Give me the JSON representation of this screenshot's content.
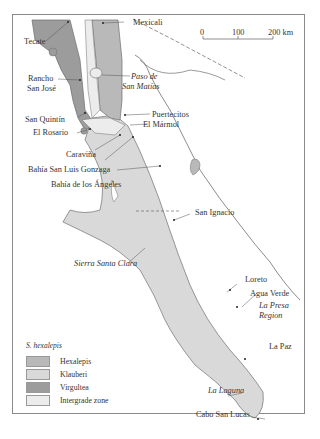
{
  "map": {
    "scale_bar": {
      "ticks": [
        "0",
        "100",
        "200 km"
      ]
    },
    "places": [
      {
        "name": "Mexicali",
        "italic": false
      },
      {
        "name": "Tecate",
        "italic": false
      },
      {
        "name": "Rancho",
        "italic": false
      },
      {
        "name": "San José",
        "italic": false
      },
      {
        "name": "Paso de",
        "italic": true
      },
      {
        "name": "San Matías",
        "italic": true
      },
      {
        "name": "Puertecitos",
        "italic": false
      },
      {
        "name": "San Quintín",
        "italic": false
      },
      {
        "name": "El Mármol",
        "italic": false
      },
      {
        "name": "El Rosario",
        "italic": false
      },
      {
        "name": "Caraviña",
        "italic": false
      },
      {
        "name": "Bahía San Luis Gonzaga",
        "italic": false
      },
      {
        "name": "Bahía de los Ángeles",
        "italic": false
      },
      {
        "name": "San Ignacio",
        "italic": false
      },
      {
        "name": "Sierra Santa Clara",
        "italic": true
      },
      {
        "name": "Loreto",
        "italic": false
      },
      {
        "name": "Agua Verde",
        "italic": false
      },
      {
        "name": "La Presa",
        "italic": true
      },
      {
        "name": "Region",
        "italic": true
      },
      {
        "name": "La Paz",
        "italic": false
      },
      {
        "name": "La Laguna",
        "italic": true
      },
      {
        "name": "Cabo San Lucas",
        "italic": false
      }
    ],
    "legend": {
      "title": "S. hexalepis",
      "items": [
        {
          "label": "Hexalepis",
          "color": "#b9b9b9"
        },
        {
          "label": "Klauberi",
          "color": "#d9d9d9"
        },
        {
          "label": "Virgultea",
          "color": "#9c9c9c"
        },
        {
          "label": "Intergrade zone",
          "color": "#ececec"
        }
      ]
    },
    "colors": {
      "hexalepis": "#b9b9b9",
      "klauberi": "#d9d9d9",
      "virgultea": "#9c9c9c",
      "intergrade": "#ececec",
      "coast": "#6e6e6e"
    }
  }
}
